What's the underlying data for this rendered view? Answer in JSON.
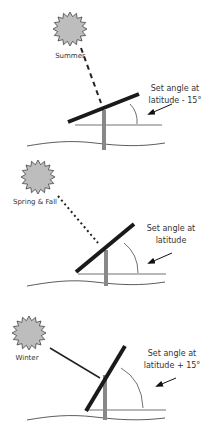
{
  "colors": {
    "panel": "#1a1a1a",
    "pole": "#888888",
    "sun_fill": "#bdbdbd",
    "sun_stroke": "#444444",
    "line": "#222222",
    "text": "#333333"
  },
  "panels": [
    {
      "season": "Summer",
      "caption_line1": "Set angle at",
      "caption_line2": "latitude - 15°",
      "ray_style": "dashed"
    },
    {
      "season": "Spring & Fall",
      "caption_line1": "Set angle at",
      "caption_line2": "latitude",
      "ray_style": "dotted"
    },
    {
      "season": "Winter",
      "caption_line1": "Set angle at",
      "caption_line2": "latitude + 15°",
      "ray_style": "solid"
    }
  ]
}
